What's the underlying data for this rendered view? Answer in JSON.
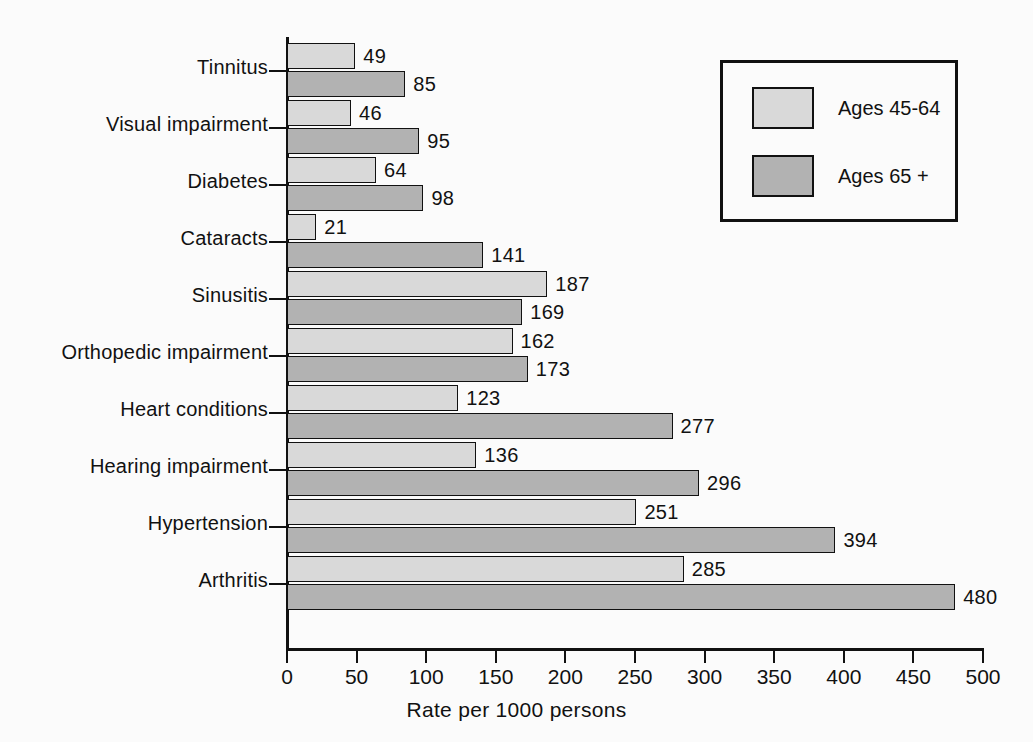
{
  "chart_data": {
    "type": "bar",
    "orientation": "horizontal",
    "title": "",
    "xlabel": "Rate per 1000 persons",
    "ylabel": "",
    "xlim": [
      0,
      500
    ],
    "xticks": [
      0,
      50,
      100,
      150,
      200,
      250,
      300,
      350,
      400,
      450,
      500
    ],
    "grid": false,
    "legend_position": "top-right",
    "categories": [
      "Tinnitus",
      "Visual impairment",
      "Diabetes",
      "Cataracts",
      "Sinusitis",
      "Orthopedic impairment",
      "Heart conditions",
      "Hearing impairment",
      "Hypertension",
      "Arthritis"
    ],
    "series": [
      {
        "name": "Ages 45-64",
        "color": "#d9d9d9",
        "values": [
          49,
          46,
          64,
          21,
          187,
          162,
          123,
          136,
          251,
          285
        ]
      },
      {
        "name": "Ages 65 +",
        "color": "#b2b2b2",
        "values": [
          85,
          95,
          98,
          141,
          169,
          173,
          277,
          296,
          394,
          480
        ]
      }
    ]
  },
  "legend": {
    "items": [
      {
        "label": "Ages 45-64",
        "swatch": "light"
      },
      {
        "label": "Ages 65 +",
        "swatch": "dark"
      }
    ]
  },
  "axis": {
    "x_title": "Rate per 1000 persons",
    "tick_labels": [
      "0",
      "50",
      "100",
      "150",
      "200",
      "250",
      "300",
      "350",
      "400",
      "450",
      "500"
    ]
  },
  "colors": {
    "series_light": "#d9d9d9",
    "series_dark": "#b2b2b2",
    "ink": "#111111",
    "background": "#fbfbfb"
  }
}
